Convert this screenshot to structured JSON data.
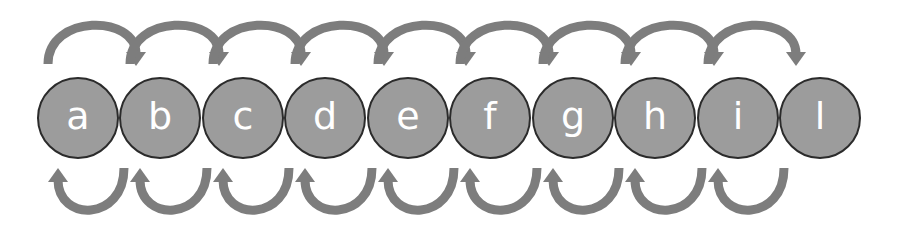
{
  "diagram": {
    "title": "",
    "colors": {
      "node_fill": "#9c9c9c",
      "node_stroke": "#2b2b2b",
      "node_text": "#ffffff",
      "arrow": "#7d7d7d",
      "background": "#ffffff"
    },
    "nodes": [
      {
        "id": "a",
        "label": "a",
        "cx": 78
      },
      {
        "id": "b",
        "label": "b",
        "cx": 160
      },
      {
        "id": "c",
        "label": "c",
        "cx": 243
      },
      {
        "id": "d",
        "label": "d",
        "cx": 325
      },
      {
        "id": "e",
        "label": "e",
        "cx": 408
      },
      {
        "id": "f",
        "label": "f",
        "cx": 490
      },
      {
        "id": "g",
        "label": "g",
        "cx": 573
      },
      {
        "id": "h",
        "label": "h",
        "cx": 655
      },
      {
        "id": "i",
        "label": "i",
        "cx": 738
      },
      {
        "id": "l",
        "label": "l",
        "cx": 820
      }
    ],
    "node_cy": 118,
    "node_r": 40,
    "forward_arrows": [
      {
        "from": "a",
        "to": "b"
      },
      {
        "from": "b",
        "to": "c"
      },
      {
        "from": "c",
        "to": "d"
      },
      {
        "from": "d",
        "to": "e"
      },
      {
        "from": "e",
        "to": "f"
      },
      {
        "from": "f",
        "to": "g"
      },
      {
        "from": "g",
        "to": "h"
      },
      {
        "from": "h",
        "to": "i"
      },
      {
        "from": "i",
        "to": "l"
      }
    ],
    "backward_arrows": [
      {
        "from": "b",
        "to": "a"
      },
      {
        "from": "c",
        "to": "b"
      },
      {
        "from": "d",
        "to": "c"
      },
      {
        "from": "e",
        "to": "d"
      },
      {
        "from": "f",
        "to": "e"
      },
      {
        "from": "g",
        "to": "f"
      },
      {
        "from": "h",
        "to": "g"
      },
      {
        "from": "i",
        "to": "h"
      },
      {
        "from": "l",
        "to": "i"
      }
    ]
  }
}
